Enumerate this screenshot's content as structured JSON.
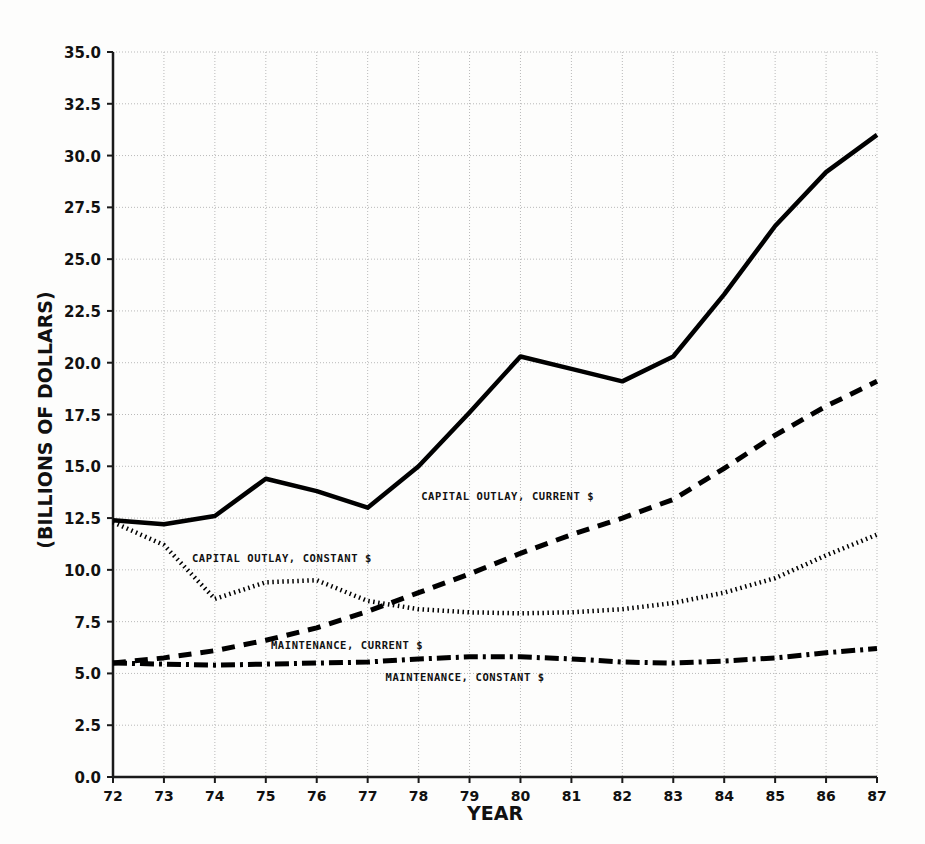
{
  "chart_data": {
    "type": "line",
    "title": "",
    "xlabel": "YEAR",
    "ylabel": "(BILLIONS OF DOLLARS)",
    "x": [
      72,
      73,
      74,
      75,
      76,
      77,
      78,
      79,
      80,
      81,
      82,
      83,
      84,
      85,
      86,
      87
    ],
    "xtick_labels": [
      "72",
      "73",
      "74",
      "75",
      "76",
      "77",
      "78",
      "79",
      "80",
      "81",
      "82",
      "83",
      "84",
      "85",
      "86",
      "87"
    ],
    "ytick_labels": [
      "0.0",
      "2.5",
      "5.0",
      "7.5",
      "10.0",
      "12.5",
      "15.0",
      "17.5",
      "20.0",
      "22.5",
      "25.0",
      "27.5",
      "30.0",
      "32.5",
      "35.0"
    ],
    "xlim": [
      72,
      87
    ],
    "ylim": [
      0.0,
      35.0
    ],
    "ytick_step": 2.5,
    "grid": true,
    "legend_position": "inline-annotations",
    "series": [
      {
        "name": "CAPITAL OUTLAY, CURRENT $",
        "style": "solid",
        "color": "#000000",
        "label_x": 78.05,
        "label_y": 13.55,
        "values": [
          12.4,
          12.2,
          12.6,
          14.4,
          13.8,
          13.0,
          15.0,
          17.6,
          20.3,
          19.7,
          19.1,
          20.3,
          23.3,
          26.6,
          29.2,
          31.0
        ]
      },
      {
        "name": "CAPITAL OUTLAY, CONSTANT $",
        "style": "dotted",
        "color": "#000000",
        "label_x": 73.55,
        "label_y": 10.55,
        "values": [
          12.3,
          11.2,
          8.6,
          9.4,
          9.5,
          8.5,
          8.1,
          7.95,
          7.9,
          7.95,
          8.1,
          8.4,
          8.9,
          9.6,
          10.7,
          11.7
        ]
      },
      {
        "name": "MAINTENANCE, CURRENT $",
        "style": "dashed",
        "color": "#000000",
        "label_x": 75.1,
        "label_y": 6.35,
        "values": [
          5.5,
          5.75,
          6.1,
          6.6,
          7.2,
          8.0,
          8.9,
          9.8,
          10.8,
          11.7,
          12.5,
          13.4,
          14.9,
          16.5,
          17.9,
          19.1
        ]
      },
      {
        "name": "MAINTENANCE, CONSTANT $",
        "style": "dashdot",
        "color": "#000000",
        "label_x": 77.35,
        "label_y": 4.85,
        "values": [
          5.5,
          5.45,
          5.4,
          5.45,
          5.5,
          5.55,
          5.7,
          5.8,
          5.8,
          5.7,
          5.55,
          5.5,
          5.6,
          5.75,
          6.0,
          6.2
        ]
      }
    ]
  },
  "figure": {
    "axis_color": "#1a1a1a",
    "grid_color": "#b9b9b9",
    "background": "#fdfdfc"
  }
}
